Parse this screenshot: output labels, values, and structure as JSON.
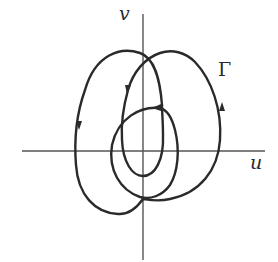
{
  "diagram": {
    "type": "phase-portrait",
    "axes": {
      "x_label": "u",
      "y_label": "v"
    },
    "curve": {
      "label": "Γ",
      "description": "Closed trajectory winding around the origin with directional arrows"
    },
    "colors": {
      "background": "#ffffff",
      "axis": "#555555",
      "curve": "#2a2a2a",
      "text": "#2a2a2a"
    }
  }
}
